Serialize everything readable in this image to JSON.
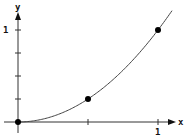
{
  "chart_data": {
    "type": "line",
    "title": "",
    "xlabel": "x",
    "ylabel": "y",
    "xlim": [
      0,
      1.1
    ],
    "ylim": [
      0,
      1.15
    ],
    "x_ticks": [
      0.5,
      1
    ],
    "x_tick_labels": [
      "",
      "1"
    ],
    "y_ticks": [
      0.25,
      0.5,
      0.75,
      1
    ],
    "y_tick_labels": [
      "",
      "",
      "",
      "1"
    ],
    "grid": false,
    "legend": null,
    "series": [
      {
        "name": "curve",
        "function": "y = x^2",
        "x": [
          0,
          0.1,
          0.2,
          0.3,
          0.4,
          0.5,
          0.6,
          0.7,
          0.8,
          0.9,
          1.0
        ],
        "y": [
          0,
          0.01,
          0.04,
          0.09,
          0.16,
          0.25,
          0.36,
          0.49,
          0.64,
          0.81,
          1.0
        ]
      }
    ],
    "marked_points": [
      {
        "x": 0,
        "y": 0
      },
      {
        "x": 0.5,
        "y": 0.25
      },
      {
        "x": 1,
        "y": 1
      }
    ],
    "colors": {
      "line": "#444444",
      "axis": "#333333",
      "point": "#000000"
    }
  }
}
